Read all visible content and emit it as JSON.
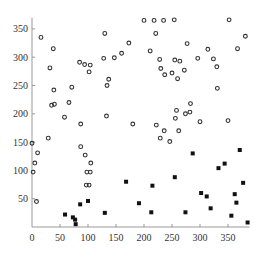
{
  "chart_data": {
    "type": "scatter",
    "title": "",
    "xlabel": "",
    "ylabel": "",
    "xlim": [
      0,
      385
    ],
    "ylim": [
      0,
      370
    ],
    "x_ticks": [
      0,
      50,
      100,
      150,
      200,
      250,
      300,
      350
    ],
    "y_ticks": [
      50,
      100,
      150,
      200,
      250,
      300,
      350
    ],
    "x_tick_labels": [
      "0",
      "50",
      "100",
      "150",
      "200",
      "250",
      "300",
      "350"
    ],
    "y_tick_labels": [
      "50",
      "100",
      "150",
      "200",
      "250",
      "300",
      "350"
    ],
    "grid": false,
    "legend": null,
    "series": [
      {
        "name": "circles",
        "marker": "open-circle",
        "color": "#333333",
        "points": [
          [
            16,
            335
          ],
          [
            38,
            315
          ],
          [
            32,
            281
          ],
          [
            39,
            242
          ],
          [
            71,
            247
          ],
          [
            35,
            215
          ],
          [
            66,
            220
          ],
          [
            87,
            182
          ],
          [
            85,
            291
          ],
          [
            94,
            287
          ],
          [
            104,
            286
          ],
          [
            102,
            274
          ],
          [
            130,
            342
          ],
          [
            128,
            298
          ],
          [
            137,
            261
          ],
          [
            134,
            250
          ],
          [
            147,
            299
          ],
          [
            160,
            307
          ],
          [
            173,
            325
          ],
          [
            180,
            182
          ],
          [
            133,
            196
          ],
          [
            200,
            365
          ],
          [
            218,
            365
          ],
          [
            221,
            342
          ],
          [
            235,
            365
          ],
          [
            254,
            366
          ],
          [
            277,
            324
          ],
          [
            211,
            311
          ],
          [
            228,
            296
          ],
          [
            230,
            280
          ],
          [
            237,
            269
          ],
          [
            250,
            272
          ],
          [
            255,
            295
          ],
          [
            264,
            293
          ],
          [
            260,
            262
          ],
          [
            272,
            277
          ],
          [
            296,
            298
          ],
          [
            314,
            314
          ],
          [
            324,
            297
          ],
          [
            330,
            283
          ],
          [
            331,
            245
          ],
          [
            352,
            366
          ],
          [
            367,
            315
          ],
          [
            381,
            337
          ],
          [
            350,
            188
          ],
          [
            283,
            218
          ],
          [
            274,
            200
          ],
          [
            256,
            192
          ],
          [
            258,
            206
          ],
          [
            262,
            170
          ],
          [
            236,
            170
          ],
          [
            229,
            157
          ],
          [
            246,
            151
          ],
          [
            222,
            180
          ],
          [
            282,
            203
          ],
          [
            300,
            186
          ],
          [
            0,
            148
          ],
          [
            10,
            131
          ],
          [
            5,
            113
          ],
          [
            2,
            97
          ],
          [
            29,
            157
          ],
          [
            8,
            45
          ],
          [
            87,
            142
          ],
          [
            95,
            127
          ],
          [
            105,
            113
          ],
          [
            98,
            97
          ],
          [
            104,
            97
          ],
          [
            97,
            74
          ],
          [
            102,
            74
          ],
          [
            58,
            194
          ],
          [
            40,
            217
          ]
        ]
      },
      {
        "name": "squares",
        "marker": "filled-square",
        "color": "#111111",
        "points": [
          [
            59,
            22
          ],
          [
            73,
            17
          ],
          [
            77,
            13
          ],
          [
            78,
            5
          ],
          [
            86,
            40
          ],
          [
            100,
            46
          ],
          [
            130,
            25
          ],
          [
            168,
            80
          ],
          [
            191,
            42
          ],
          [
            213,
            26
          ],
          [
            215,
            73
          ],
          [
            255,
            88
          ],
          [
            274,
            26
          ],
          [
            287,
            130
          ],
          [
            302,
            60
          ],
          [
            312,
            54
          ],
          [
            319,
            33
          ],
          [
            333,
            104
          ],
          [
            344,
            112
          ],
          [
            356,
            20
          ],
          [
            362,
            58
          ],
          [
            365,
            43
          ],
          [
            371,
            136
          ],
          [
            377,
            78
          ],
          [
            385,
            8
          ]
        ]
      }
    ]
  }
}
